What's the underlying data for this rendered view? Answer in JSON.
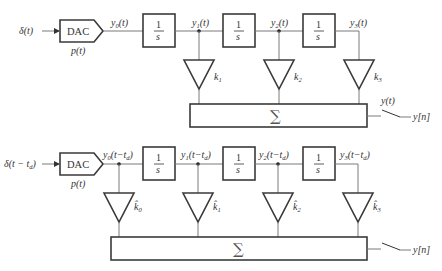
{
  "diagrams": [
    {
      "name": "continuous-state-variable-filter",
      "input_label": "δ(t)",
      "dac_label": "DAC",
      "pulse_label": "p(t)",
      "integrator_numerator": "1",
      "integrator_denominator": "s",
      "signals": [
        "y0(t)",
        "y1(t)",
        "y2(t)",
        "y3(t)"
      ],
      "gains": [
        "k1",
        "k2",
        "k3"
      ],
      "sum_symbol": "∑",
      "output_continuous": "y(t)",
      "output_sampled": "y[n]"
    },
    {
      "name": "delayed-state-variable-filter",
      "input_label": "δ(t − td)",
      "dac_label": "DAC",
      "pulse_label": "p(t)",
      "integrator_numerator": "1",
      "integrator_denominator": "s",
      "signals": [
        "y0(t − td)",
        "y1(t − td)",
        "y2(t − td)",
        "y3(t − td)"
      ],
      "gains": [
        "k̂0",
        "k̂1",
        "k̂2",
        "k̂3"
      ],
      "sum_symbol": "∑",
      "output_sampled": "y[n]"
    }
  ],
  "text": {
    "top": {
      "delta": "δ(t)",
      "dac": "DAC",
      "p": "p(t)",
      "y0": "y",
      "y0_sub": "0",
      "y0_arg": "(t)",
      "y1": "y",
      "y1_sub": "1",
      "y1_arg": "(t)",
      "y2": "y",
      "y2_sub": "2",
      "y2_arg": "(t)",
      "y3": "y",
      "y3_sub": "3",
      "y3_arg": "(t)",
      "one": "1",
      "s": "s",
      "k": "k",
      "k1_sub": "1",
      "k2_sub": "2",
      "k3_sub": "3",
      "sigma": "∑",
      "yt": "y(t)",
      "yn": "y[n]"
    },
    "bottom": {
      "delta": "δ(t − t",
      "delta_sub": "d",
      "delta_close": ")",
      "dac": "DAC",
      "p": "p(t)",
      "y": "y",
      "y0_sub": "0",
      "y1_sub": "1",
      "y2_sub": "2",
      "y3_sub": "3",
      "arg": "(t−t",
      "arg_sub": "d",
      "arg_close": ")",
      "one": "1",
      "s": "s",
      "khat": "k̂",
      "k0_sub": "0",
      "k1_sub": "1",
      "k2_sub": "2",
      "k3_sub": "3",
      "sigma": "∑",
      "yn": "y[n]"
    }
  }
}
